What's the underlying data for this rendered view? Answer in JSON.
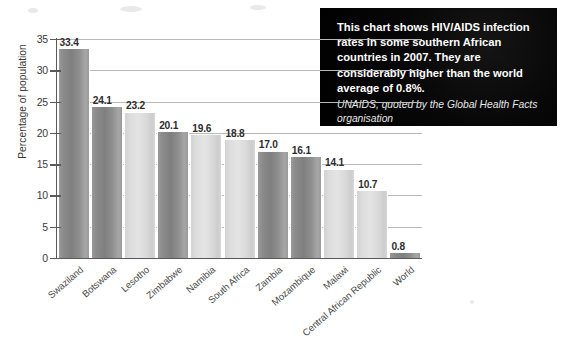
{
  "chart_data": {
    "type": "bar",
    "title": "",
    "xlabel": "",
    "ylabel": "Percentage of population",
    "ylim": [
      0,
      35
    ],
    "ytick_step": 5,
    "yticks": [
      "35",
      "30",
      "25",
      "20",
      "15",
      "10",
      "5",
      "0"
    ],
    "grid": true,
    "legend": "none",
    "categories": [
      "Swaziland",
      "Botswana",
      "Lesotho",
      "Zimbabwe",
      "Namibia",
      "South Africa",
      "Zambia",
      "Mozambique",
      "Malawi",
      "Central African Republic",
      "World"
    ],
    "values": [
      33.4,
      24.1,
      23.2,
      20.1,
      19.6,
      18.8,
      17.0,
      16.1,
      14.1,
      10.7,
      0.8
    ],
    "value_labels": [
      "33.4",
      "24.1",
      "23.2",
      "20.1",
      "19.6",
      "18.8",
      "17.0",
      "16.1",
      "14.1",
      "10.7",
      "0.8"
    ],
    "bar_shades": [
      "dark",
      "dark",
      "light",
      "dark",
      "light",
      "light",
      "dark",
      "dark",
      "light",
      "light",
      "dark"
    ],
    "colors": {
      "bar_dark": "#8b8b8b",
      "bar_light": "#dcdcdc",
      "gridline": "#b9b9b9",
      "axis": "#5a5a5a",
      "label_text": "#3b3b3b",
      "background": "#ffffff"
    }
  },
  "caption": {
    "main_text": "This chart shows HIV/AIDS infection rates in some southern African countries in 2007. They are considerably higher than the world average of 0.8%.",
    "source_text": "UNAIDS, quoted by the Global Health Facts organisation",
    "background_color": "#000000",
    "text_color": "#ffffff"
  }
}
